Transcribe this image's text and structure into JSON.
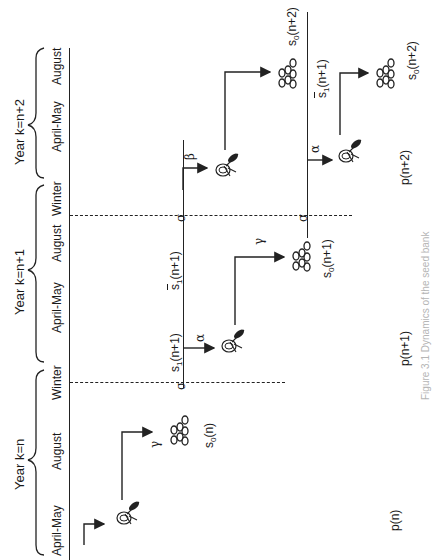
{
  "years": [
    {
      "label": "Year k=n"
    },
    {
      "label": "Year k=n+1"
    },
    {
      "label": "Year k=n+2"
    }
  ],
  "seasons": [
    {
      "label": "April-May"
    },
    {
      "label": "August"
    },
    {
      "label": "Winter"
    },
    {
      "label": "April-May"
    },
    {
      "label": "August"
    },
    {
      "label": "Winter"
    },
    {
      "label": "April-May"
    },
    {
      "label": "August"
    }
  ],
  "states": {
    "s0_n": {
      "base": "s",
      "sub": "0",
      "arg": "(n)"
    },
    "s1_n1": {
      "base": "s",
      "sub": "1",
      "arg": "(n+1)"
    },
    "s1bar_n1_a": {
      "base": "s",
      "sub": "1",
      "arg": "(n+1)",
      "overline": true
    },
    "s0_n1": {
      "base": "s",
      "sub": "0",
      "arg": "(n+1)"
    },
    "s0_n2_top": {
      "base": "s",
      "sub": "0",
      "arg": "(n+2)"
    },
    "s1bar_n1_b": {
      "base": "s",
      "sub": "1",
      "arg": "(n+1)",
      "overline": true
    },
    "s0_n2_bottom": {
      "base": "s",
      "sub": "0",
      "arg": "(n+2)"
    }
  },
  "transitions": {
    "gamma_1": "γ",
    "sigma_1": "σ",
    "alpha_1": "α",
    "gamma_2": "γ",
    "sigma_2": "σ",
    "beta": "β",
    "sigma_3": "σ",
    "alpha_2": "α"
  },
  "plants": [
    {
      "label": "p(n)"
    },
    {
      "label": "p(n+1)"
    },
    {
      "label": "p(n+2)"
    }
  ],
  "caption": "Figure 3.1 Dynamics of the seed bank"
}
